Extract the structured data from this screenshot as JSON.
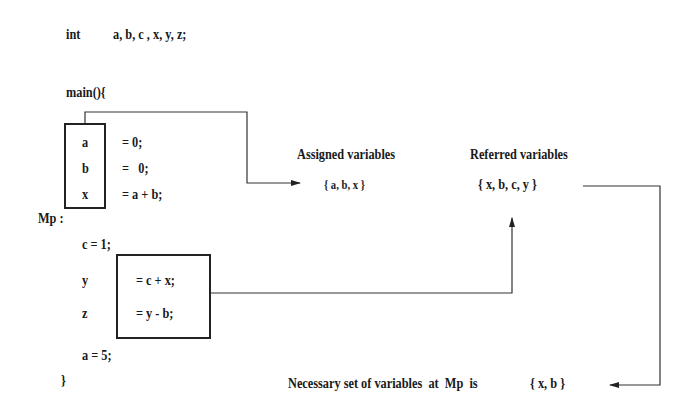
{
  "code": {
    "decl_kw": "int",
    "decl_vars": "a, b, c , x, y, z;",
    "main_open": "main(){",
    "block1": [
      {
        "var": "a",
        "expr": "= 0;"
      },
      {
        "var": "b",
        "expr": "=   0;"
      },
      {
        "var": "x",
        "expr": "= a + b;"
      }
    ],
    "label_mp": "Mp :",
    "c_assign": "c = 1;",
    "block2": [
      {
        "var": "y",
        "expr": "= c + x;"
      },
      {
        "var": "z",
        "expr": "= y - b;"
      }
    ],
    "a_assign": "a = 5;",
    "main_close": "}"
  },
  "assigned": {
    "title": "Assigned variables",
    "set": "{ a, b, x }"
  },
  "referred": {
    "title": "Referred variables",
    "set": "{ x, b, c, y }"
  },
  "result": {
    "text": "Necessary set of variables  at  Mp  is",
    "set": "{ x, b }"
  }
}
